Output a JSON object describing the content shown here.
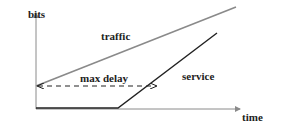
{
  "diagram": {
    "axes": {
      "y_label": "bits",
      "x_label": "time",
      "color": "#8a8a8a"
    },
    "curves": {
      "traffic": {
        "label": "traffic",
        "color": "#8a8a8a"
      },
      "service": {
        "label": "service",
        "color": "#222222"
      }
    },
    "annotations": {
      "max_delay": {
        "label": "max delay",
        "color": "#222222",
        "style": "dashed",
        "arrows": "both"
      }
    }
  }
}
